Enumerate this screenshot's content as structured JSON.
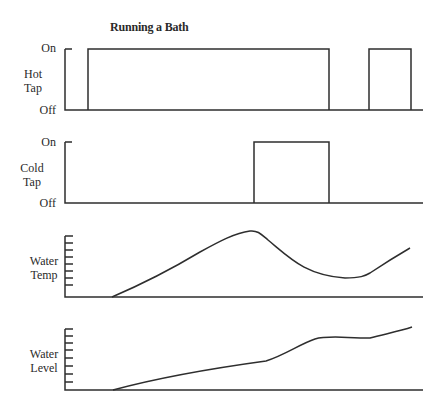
{
  "title": "Running a Bath",
  "panels": [
    {
      "id": "hot",
      "label_line1": "Hot",
      "label_line2": "Tap",
      "on_label": "On",
      "off_label": "Off"
    },
    {
      "id": "cold",
      "label_line1": "Cold",
      "label_line2": "Tap",
      "on_label": "On",
      "off_label": "Off"
    },
    {
      "id": "temp",
      "label_line1": "Water",
      "label_line2": "Temp"
    },
    {
      "id": "level",
      "label_line1": "Water",
      "label_line2": "Level"
    }
  ],
  "chart_data": [
    {
      "type": "line",
      "title": "Running a Bath",
      "ylabel": "Hot Tap",
      "ytick_labels": [
        "Off",
        "On"
      ],
      "note": "step function; x in relative time units 0-100",
      "x": [
        0,
        6,
        6,
        73,
        73,
        85,
        85,
        97,
        97,
        100
      ],
      "values": [
        0,
        0,
        1,
        1,
        0,
        0,
        1,
        1,
        0,
        0
      ]
    },
    {
      "type": "line",
      "ylabel": "Cold Tap",
      "ytick_labels": [
        "Off",
        "On"
      ],
      "x": [
        0,
        53,
        53,
        73,
        73,
        100
      ],
      "values": [
        0,
        0,
        1,
        1,
        0,
        0
      ]
    },
    {
      "type": "line",
      "ylabel": "Water Temp",
      "yticks": 8,
      "x": [
        13,
        26,
        37,
        48,
        51,
        60,
        68,
        76,
        81,
        85,
        92,
        97
      ],
      "values": [
        0,
        3,
        5.8,
        7.9,
        8.2,
        5.5,
        2.6,
        2.1,
        2.1,
        2.4,
        4.9,
        6.3
      ]
    },
    {
      "type": "line",
      "ylabel": "Water Level",
      "yticks": 8,
      "x": [
        13,
        30,
        50,
        55,
        63,
        70,
        77,
        85,
        97
      ],
      "values": [
        0,
        1.6,
        3.1,
        3.7,
        6.2,
        6.6,
        6.6,
        6.8,
        8.6
      ]
    }
  ],
  "geometry": {
    "hot": {
      "path": "M65,49 L72,49 M65,49 L65,110 L423,110 M88,110 L88,49 L329,49 L329,110 M369,110 L369,49 L411,49 L411,110"
    },
    "cold": {
      "path": "M65,142 L72,142 M65,142 L65,203 L423,203 M254,203 L254,142 L329,142 L329,203"
    },
    "temp": {
      "axis": "M65,236 L65,297 L423,297",
      "ticks": [
        236,
        243,
        250,
        257,
        264,
        271,
        278,
        285
      ],
      "curve": "M112,297 C140,285 170,270 200,252 C220,241 235,233 250,231 C258,230 262,235 268,240 C290,258 305,275 345,278 C360,278 365,276 370,273 C385,263 398,255 410,248"
    },
    "level": {
      "axis": "M65,329 L65,390 L423,390",
      "ticks": [
        329,
        336,
        343,
        350,
        358,
        366,
        374,
        382
      ],
      "curve": "M113,390 C150,380 200,370 266,361 C285,355 300,344 315,339 C328,335 345,338 370,338 C385,334 400,331 412,327"
    }
  }
}
